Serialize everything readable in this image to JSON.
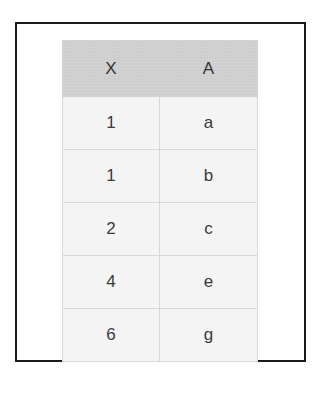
{
  "table": {
    "columns": [
      "X",
      "A"
    ],
    "rows": [
      {
        "X": "1",
        "A": "a"
      },
      {
        "X": "1",
        "A": "b"
      },
      {
        "X": "2",
        "A": "c"
      },
      {
        "X": "4",
        "A": "e"
      },
      {
        "X": "6",
        "A": "g"
      }
    ]
  },
  "colors": {
    "frame_border": "#1a1a1a",
    "header_bg": "#d2d2d2",
    "cell_bg": "#f4f4f4",
    "grid_line": "#d8d8d8",
    "text": "#3a3a3a"
  }
}
